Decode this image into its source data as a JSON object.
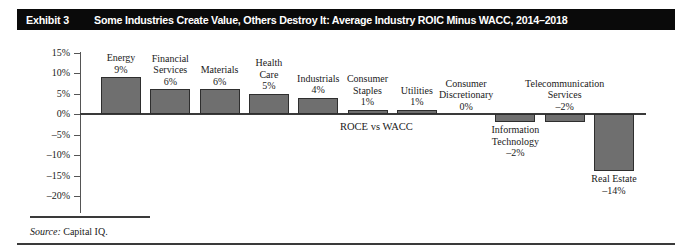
{
  "exhibit": {
    "number_label": "Exhibit 3",
    "title": "Some Industries Create Value, Others Destroy It: Average Industry ROIC Minus WACC, 2014–2018"
  },
  "source": {
    "prefix": "Source:",
    "text": " Capital IQ."
  },
  "annotation": {
    "roce_vs_wacc": "ROCE vs WACC"
  },
  "colors": {
    "header_bg": "#0a0a0a",
    "header_text": "#ffffff",
    "bar_fill": "#6f6f6f",
    "bar_stroke": "#2e2e2e",
    "axis": "#555555",
    "zero_line": "#3a3a3a"
  },
  "chart_data": {
    "type": "bar",
    "title": "Some Industries Create Value, Others Destroy It: Average Industry ROIC Minus WACC, 2014–2018",
    "xlabel": "",
    "ylabel": "",
    "ylim": [
      -20,
      15
    ],
    "ytick_labels": [
      "15%",
      "10%",
      "5%",
      "0%",
      "-5%",
      "-10%",
      "-15%",
      "-20%"
    ],
    "ytick_values": [
      15,
      10,
      5,
      0,
      -5,
      -10,
      -15,
      -20
    ],
    "grid": false,
    "legend": "none",
    "annotations": [
      "ROCE vs WACC"
    ],
    "categories": [
      "Energy",
      "Financial Services",
      "Materials",
      "Health Care",
      "Industrials",
      "Consumer Staples",
      "Utilities",
      "Consumer Discretionary",
      "Information Technology",
      "Telecommunication Services",
      "Real Estate"
    ],
    "values": [
      9,
      6,
      6,
      5,
      4,
      1,
      1,
      0,
      -2,
      -2,
      -14
    ],
    "value_labels": [
      "9%",
      "6%",
      "6%",
      "5%",
      "4%",
      "1%",
      "1%",
      "0%",
      "-2%",
      "-2%",
      "-14%"
    ],
    "bars": [
      {
        "name": "Energy",
        "label_lines": [
          "Energy"
        ],
        "value": 9,
        "value_label": "9%",
        "label_pos": "above"
      },
      {
        "name": "Financial Services",
        "label_lines": [
          "Financial",
          "Services"
        ],
        "value": 6,
        "value_label": "6%",
        "label_pos": "above"
      },
      {
        "name": "Materials",
        "label_lines": [
          "Materials"
        ],
        "value": 6,
        "value_label": "6%",
        "label_pos": "above"
      },
      {
        "name": "Health Care",
        "label_lines": [
          "Health",
          "Care"
        ],
        "value": 5,
        "value_label": "5%",
        "label_pos": "above"
      },
      {
        "name": "Industrials",
        "label_lines": [
          "Industrials"
        ],
        "value": 4,
        "value_label": "4%",
        "label_pos": "above"
      },
      {
        "name": "Consumer Staples",
        "label_lines": [
          "Consumer",
          "Staples"
        ],
        "value": 1,
        "value_label": "1%",
        "label_pos": "above"
      },
      {
        "name": "Utilities",
        "label_lines": [
          "Utilities"
        ],
        "value": 1,
        "value_label": "1%",
        "label_pos": "above"
      },
      {
        "name": "Consumer Discretionary",
        "label_lines": [
          "Consumer",
          "Discretionary"
        ],
        "value": 0,
        "value_label": "0%",
        "label_pos": "above"
      },
      {
        "name": "Information Technology",
        "label_lines": [
          "Information",
          "Technology"
        ],
        "value": -2,
        "value_label": "-2%",
        "label_pos": "below"
      },
      {
        "name": "Telecommunication Services",
        "label_lines": [
          "Telecommunication",
          "Services"
        ],
        "value": -2,
        "value_label": "-2%",
        "label_pos": "above"
      },
      {
        "name": "Real Estate",
        "label_lines": [
          "Real Estate"
        ],
        "value": -14,
        "value_label": "-14%",
        "label_pos": "below"
      }
    ]
  }
}
